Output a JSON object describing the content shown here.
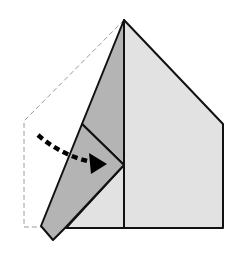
{
  "diagram": {
    "type": "origami-fold-step",
    "colors": {
      "background": "#ffffff",
      "paper_light": "#e2e2e2",
      "paper_dark": "#b4b4b4",
      "outline": "#111111",
      "dashed_outline": "#9a9a9a",
      "arrow": "#000000"
    },
    "arrow": {
      "style": "dashed-curved",
      "direction": "right",
      "meaning": "fold-in"
    }
  }
}
